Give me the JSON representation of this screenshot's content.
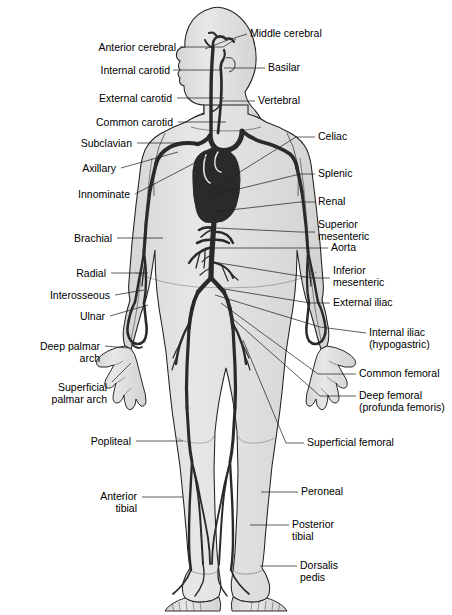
{
  "figure": {
    "colors": {
      "background": "#ffffff",
      "body_fill": "#e3e3e1",
      "body_outline": "#231f20",
      "artery_dark": "#2b2a2a",
      "artery_mid": "#4a4848",
      "leader_line": "#231f20",
      "text": "#000000"
    },
    "body": {
      "view": "anterior-whole-body-with-profile-head",
      "parts": [
        "head",
        "neck",
        "torso",
        "arms",
        "hands",
        "legs",
        "feet"
      ]
    }
  },
  "labels_left": [
    {
      "id": "anterior-cerebral",
      "text": "Anterior cerebral",
      "lines": [
        "Anterior cerebral"
      ],
      "text_x": 176,
      "text_y": 42,
      "leader": [
        [
          180,
          47
        ],
        [
          223,
          47
        ],
        [
          236,
          39
        ]
      ]
    },
    {
      "id": "internal-carotid",
      "text": "Internal carotid",
      "lines": [
        "Internal carotid"
      ],
      "text_x": 170,
      "text_y": 65,
      "leader": [
        [
          173,
          70
        ],
        [
          222,
          70
        ]
      ]
    },
    {
      "id": "external-carotid",
      "text": "External carotid",
      "lines": [
        "External carotid"
      ],
      "text_x": 172,
      "text_y": 93,
      "leader": [
        [
          177,
          98
        ],
        [
          224,
          98
        ]
      ]
    },
    {
      "id": "common-carotid",
      "text": "Common carotid",
      "lines": [
        "Common carotid"
      ],
      "text_x": 173,
      "text_y": 117,
      "leader": [
        [
          178,
          122
        ],
        [
          226,
          122
        ]
      ]
    },
    {
      "id": "subclavian",
      "text": "Subclavian",
      "lines": [
        "Subclavian"
      ],
      "text_x": 132,
      "text_y": 138,
      "leader": [
        [
          137,
          143
        ],
        [
          202,
          143
        ]
      ]
    },
    {
      "id": "axillary",
      "text": "Axillary",
      "lines": [
        "Axillary"
      ],
      "text_x": 116,
      "text_y": 163,
      "leader": [
        [
          121,
          168
        ],
        [
          178,
          152
        ]
      ]
    },
    {
      "id": "innominate",
      "text": "Innominate",
      "lines": [
        "Innominate"
      ],
      "text_x": 130,
      "text_y": 189,
      "leader": [
        [
          135,
          194
        ],
        [
          210,
          155
        ]
      ]
    },
    {
      "id": "brachial",
      "text": "Brachial",
      "lines": [
        "Brachial"
      ],
      "text_x": 112,
      "text_y": 233,
      "leader": [
        [
          117,
          238
        ],
        [
          163,
          238
        ]
      ]
    },
    {
      "id": "radial",
      "text": "Radial",
      "lines": [
        "Radial"
      ],
      "text_x": 106,
      "text_y": 268,
      "leader": [
        [
          111,
          273
        ],
        [
          148,
          273
        ]
      ]
    },
    {
      "id": "interosseous",
      "text": "Interosseous",
      "lines": [
        "Interosseous"
      ],
      "text_x": 110,
      "text_y": 290,
      "leader": [
        [
          115,
          295
        ],
        [
          144,
          290
        ]
      ]
    },
    {
      "id": "ulnar",
      "text": "Ulnar",
      "lines": [
        "Ulnar"
      ],
      "text_x": 105,
      "text_y": 311,
      "leader": [
        [
          110,
          316
        ],
        [
          148,
          305
        ]
      ]
    },
    {
      "id": "deep-palmar-arch",
      "text": "Deep palmar arch",
      "lines": [
        "Deep palmar",
        "arch"
      ],
      "text_x": 100,
      "text_y": 341,
      "leader": [
        [
          105,
          346
        ],
        [
          128,
          348
        ]
      ]
    },
    {
      "id": "superficial-palmar-arch",
      "text": "Superficial palmar arch",
      "lines": [
        "Superficial",
        "palmar arch"
      ],
      "text_x": 107,
      "text_y": 382,
      "leader": [
        [
          112,
          382
        ],
        [
          131,
          363
        ]
      ]
    },
    {
      "id": "popliteal",
      "text": "Popliteal",
      "lines": [
        "Popliteal"
      ],
      "text_x": 131,
      "text_y": 436,
      "leader": [
        [
          136,
          441
        ],
        [
          183,
          441
        ]
      ]
    },
    {
      "id": "anterior-tibial",
      "text": "Anterior tibial",
      "lines": [
        "Anterior",
        "tibial"
      ],
      "text_x": 137,
      "text_y": 491,
      "leader": [
        [
          142,
          497
        ],
        [
          183,
          497
        ]
      ]
    }
  ],
  "labels_right": [
    {
      "id": "middle-cerebral",
      "text": "Middle cerebral",
      "lines": [
        "Middle cerebral"
      ],
      "text_x": 250,
      "text_y": 28,
      "leader": [
        [
          247,
          34
        ],
        [
          225,
          41
        ],
        [
          205,
          49
        ]
      ]
    },
    {
      "id": "basilar",
      "text": "Basilar",
      "lines": [
        "Basilar"
      ],
      "text_x": 268,
      "text_y": 62,
      "leader": [
        [
          265,
          68
        ],
        [
          224,
          68
        ]
      ]
    },
    {
      "id": "vertebral",
      "text": "Vertebral",
      "lines": [
        "Vertebral"
      ],
      "text_x": 258,
      "text_y": 95,
      "leader": [
        [
          255,
          101
        ],
        [
          221,
          101
        ]
      ]
    },
    {
      "id": "celiac",
      "text": "Celiac",
      "lines": [
        "Celiac"
      ],
      "text_x": 318,
      "text_y": 131,
      "leader": [
        [
          315,
          137
        ],
        [
          296,
          137
        ],
        [
          208,
          192
        ]
      ]
    },
    {
      "id": "splenic",
      "text": "Splenic",
      "lines": [
        "Splenic"
      ],
      "text_x": 318,
      "text_y": 168,
      "leader": [
        [
          315,
          174
        ],
        [
          300,
          174
        ],
        [
          210,
          196
        ]
      ]
    },
    {
      "id": "renal",
      "text": "Renal",
      "lines": [
        "Renal"
      ],
      "text_x": 318,
      "text_y": 196,
      "leader": [
        [
          315,
          202
        ],
        [
          300,
          202
        ],
        [
          213,
          212
        ]
      ]
    },
    {
      "id": "superior-mesenteric",
      "text": "Superior mesenteric",
      "lines": [
        "Superior",
        "mesenteric"
      ],
      "text_x": 318,
      "text_y": 219,
      "leader": [
        [
          315,
          232
        ],
        [
          300,
          232
        ],
        [
          216,
          228
        ]
      ]
    },
    {
      "id": "aorta",
      "text": "Aorta",
      "lines": [
        "Aorta"
      ],
      "text_x": 331,
      "text_y": 242,
      "leader": [
        [
          328,
          248
        ],
        [
          205,
          248
        ]
      ]
    },
    {
      "id": "inferior-mesenteric",
      "text": "Inferior mesenteric",
      "lines": [
        "Inferior",
        "mesenteric"
      ],
      "text_x": 333,
      "text_y": 265,
      "leader": [
        [
          330,
          278
        ],
        [
          312,
          278
        ],
        [
          213,
          262
        ]
      ]
    },
    {
      "id": "external-iliac",
      "text": "External iliac",
      "lines": [
        "External iliac"
      ],
      "text_x": 333,
      "text_y": 297,
      "leader": [
        [
          330,
          303
        ],
        [
          310,
          303
        ],
        [
          218,
          288
        ]
      ]
    },
    {
      "id": "internal-iliac",
      "text": "Internal iliac (hypogastric)",
      "lines": [
        "Internal iliac",
        "(hypogastric)"
      ],
      "text_x": 369,
      "text_y": 327,
      "leader": [
        [
          366,
          333
        ],
        [
          320,
          327
        ],
        [
          215,
          295
        ]
      ]
    },
    {
      "id": "common-femoral",
      "text": "Common femoral",
      "lines": [
        "Common femoral"
      ],
      "text_x": 359,
      "text_y": 368,
      "leader": [
        [
          356,
          374
        ],
        [
          318,
          374
        ],
        [
          221,
          303
        ]
      ]
    },
    {
      "id": "deep-femoral",
      "text": "Deep femoral (profunda femoris)",
      "lines": [
        "Deep femoral",
        "(profunda femoris)"
      ],
      "text_x": 359,
      "text_y": 390,
      "leader": [
        [
          356,
          396
        ],
        [
          320,
          396
        ],
        [
          232,
          318
        ]
      ]
    },
    {
      "id": "superficial-femoral",
      "text": "Superficial femoral",
      "lines": [
        "Superficial femoral"
      ],
      "text_x": 307,
      "text_y": 437,
      "leader": [
        [
          304,
          443
        ],
        [
          286,
          443
        ],
        [
          243,
          340
        ]
      ]
    },
    {
      "id": "peroneal",
      "text": "Peroneal",
      "lines": [
        "Peroneal"
      ],
      "text_x": 301,
      "text_y": 486,
      "leader": [
        [
          298,
          492
        ],
        [
          261,
          492
        ]
      ]
    },
    {
      "id": "posterior-tibial",
      "text": "Posterior tibial",
      "lines": [
        "Posterior",
        "tibial"
      ],
      "text_x": 292,
      "text_y": 519,
      "leader": [
        [
          289,
          525
        ],
        [
          250,
          525
        ]
      ]
    },
    {
      "id": "dorsalis-pedis",
      "text": "Dorsalis pedis",
      "lines": [
        "Dorsalis",
        "pedis"
      ],
      "text_x": 300,
      "text_y": 560,
      "leader": [
        [
          297,
          566
        ],
        [
          260,
          566
        ]
      ]
    }
  ]
}
